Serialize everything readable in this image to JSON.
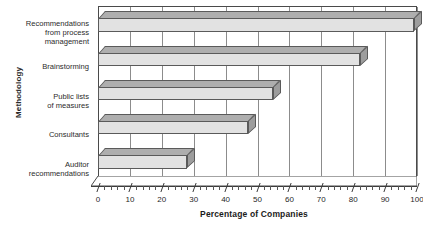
{
  "clipped_title_remnant": "·· ····· ··· ···",
  "chart_data": {
    "type": "bar",
    "orientation": "horizontal",
    "title": "",
    "xlabel": "Percentage of Companies",
    "ylabel": "Methodology",
    "categories": [
      "Recommendations from process management",
      "Brainstorming",
      "Public lists of measures",
      "Consultants",
      "Auditor recommendations"
    ],
    "category_lines": [
      [
        "Recommendations",
        "from process",
        "management"
      ],
      [
        "Brainstorming"
      ],
      [
        "Public lists",
        "of measures"
      ],
      [
        "Consultants"
      ],
      [
        "Auditor",
        "recommendations"
      ]
    ],
    "values": [
      99,
      82,
      55,
      47,
      28
    ],
    "xlim": [
      0,
      100
    ],
    "xticks": [
      0,
      10,
      20,
      30,
      40,
      50,
      60,
      70,
      80,
      90,
      100
    ],
    "xtick_labels": [
      "0",
      "10",
      "20",
      "30",
      "40",
      "50",
      "60",
      "70",
      "80",
      "90",
      "100"
    ],
    "minor_tick_interval": 2,
    "grid": "vertical",
    "legend": null,
    "style": "3d-horizontal-bar",
    "colors": {
      "bar_front": "#e2e2e2",
      "bar_top": "#aeaeae",
      "bar_side": "#9d9d9d",
      "bar_edge": "#5a5a5a",
      "gridline": "#8c8c8c",
      "axis": "#3c3c3c",
      "text": "#1f1f1f",
      "background": "#ffffff"
    }
  }
}
